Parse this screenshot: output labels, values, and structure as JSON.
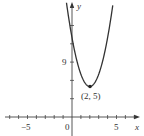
{
  "chart_data": {
    "type": "line",
    "title": "",
    "function": "y = 2(x - 2)^2 + 5",
    "xlabel": "x",
    "ylabel": "y",
    "xlim": [
      -7,
      7
    ],
    "ylim": [
      -2,
      19
    ],
    "x_tick_step": 1,
    "y_tick_step": 3,
    "x_tick_labels": [
      {
        "value": -5,
        "label": "−5"
      },
      {
        "value": 0,
        "label": "0"
      },
      {
        "value": 5,
        "label": "5"
      }
    ],
    "y_tick_labels": [
      {
        "value": 9,
        "label": "9"
      }
    ],
    "annotations": [
      {
        "x": 2,
        "y": 5,
        "label": "(2, 5)",
        "marker": "point"
      }
    ],
    "series": [
      {
        "name": "parabola",
        "x": [
          -0.6,
          0,
          1,
          2,
          3,
          4,
          4.6
        ],
        "values": [
          18.5,
          13,
          7,
          5,
          7,
          13,
          18.5
        ]
      }
    ],
    "grid": false,
    "legend": null,
    "colors": {
      "curve": "#333333",
      "axes": "#444444"
    }
  }
}
